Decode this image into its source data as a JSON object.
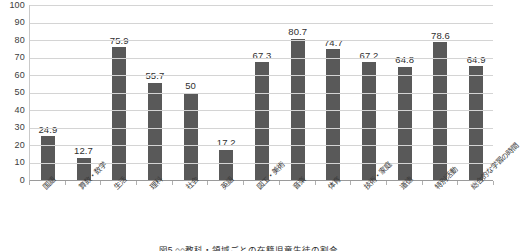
{
  "chart_data": {
    "type": "bar",
    "title": "",
    "xlabel": "",
    "ylabel": "",
    "ylim": [
      0,
      100
    ],
    "grid": true,
    "legend": false,
    "bar_color": "#595959",
    "categories": [
      "国語",
      "算数・数学",
      "生活",
      "理科",
      "社会",
      "英語",
      "図工・美術",
      "音楽",
      "体育",
      "技術・家庭",
      "道徳",
      "特別活動",
      "総合的な学習の時間"
    ],
    "values": [
      24.9,
      12.7,
      75.9,
      55.7,
      50,
      17.2,
      67.3,
      80.7,
      74.7,
      67.2,
      64.8,
      78.6,
      64.9
    ],
    "value_labels": [
      "24.9",
      "12.7",
      "75.9",
      "55.7",
      "50",
      "17.2",
      "67.3",
      "80.7",
      "74.7",
      "67.2",
      "64.8",
      "78.6",
      "64.9"
    ],
    "y_ticks": [
      0,
      10,
      20,
      30,
      40,
      50,
      60,
      70,
      80,
      90,
      100
    ],
    "y_tick_labels": [
      "0",
      "10",
      "20",
      "30",
      "40",
      "50",
      "60",
      "70",
      "80",
      "90",
      "100"
    ]
  },
  "caption": {
    "text": "図5 ○○教科・領域ごとの在籍児童生徒の割合"
  }
}
